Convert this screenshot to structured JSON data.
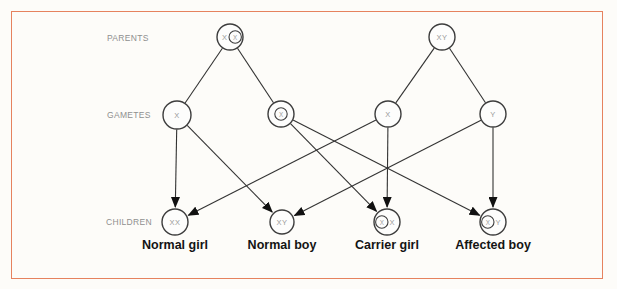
{
  "figure": {
    "background": "#fdfcf9",
    "border_color": "#e6825f",
    "line_color": "#333333",
    "arrow_color": "#111111",
    "node_stroke": "#3d3d3d",
    "node_fill": "#fdfdfc",
    "allele_color": "#9a9a9a",
    "row_label_color": "#8f8f8f",
    "caption_color": "#141414"
  },
  "diagram": {
    "row_labels": [
      {
        "id": "parents",
        "text": "PARENTS",
        "x": 107,
        "y": 41
      },
      {
        "id": "gametes",
        "text": "GAMETES",
        "x": 107,
        "y": 118
      },
      {
        "id": "children",
        "text": "CHILDREN",
        "x": 106,
        "y": 225
      }
    ],
    "nodes": [
      {
        "id": "mother",
        "row": "parents",
        "x": 230,
        "y": 37,
        "r": 13,
        "parts": [
          {
            "text": "X",
            "circled": false
          },
          {
            "text": "X",
            "circled": true
          }
        ]
      },
      {
        "id": "father",
        "row": "parents",
        "x": 442,
        "y": 37,
        "r": 13,
        "parts": [
          {
            "text": "XY",
            "circled": false
          }
        ]
      },
      {
        "id": "gamete-x-mother",
        "row": "gametes",
        "x": 177,
        "y": 115,
        "r": 14,
        "parts": [
          {
            "text": "X",
            "circled": false
          }
        ]
      },
      {
        "id": "gamete-xcarrier-mother",
        "row": "gametes",
        "x": 281,
        "y": 114,
        "r": 13,
        "parts": [
          {
            "text": "X",
            "circled": true
          }
        ]
      },
      {
        "id": "gamete-x-father",
        "row": "gametes",
        "x": 388,
        "y": 114,
        "r": 13,
        "parts": [
          {
            "text": "X",
            "circled": false
          }
        ]
      },
      {
        "id": "gamete-y-father",
        "row": "gametes",
        "x": 493,
        "y": 114,
        "r": 13,
        "parts": [
          {
            "text": "Y",
            "circled": false
          }
        ]
      },
      {
        "id": "child-normal-girl",
        "row": "children",
        "x": 175,
        "y": 222,
        "r": 13,
        "parts": [
          {
            "text": "XX",
            "circled": false
          }
        ],
        "caption": "Normal girl"
      },
      {
        "id": "child-normal-boy",
        "row": "children",
        "x": 282,
        "y": 222,
        "r": 12,
        "parts": [
          {
            "text": "XY",
            "circled": false
          }
        ],
        "caption": "Normal boy"
      },
      {
        "id": "child-carrier-girl",
        "row": "children",
        "x": 387,
        "y": 222,
        "r": 13,
        "parts": [
          {
            "text": "X",
            "circled": true
          },
          {
            "text": "X",
            "circled": false
          }
        ],
        "caption": "Carrier girl"
      },
      {
        "id": "child-affected-boy",
        "row": "children",
        "x": 493,
        "y": 222,
        "r": 13,
        "parts": [
          {
            "text": "X",
            "circled": true
          },
          {
            "text": "Y",
            "circled": false
          }
        ],
        "caption": "Affected boy"
      }
    ],
    "edges": [
      {
        "from": "mother",
        "to": "gamete-x-mother",
        "arrow": false
      },
      {
        "from": "mother",
        "to": "gamete-xcarrier-mother",
        "arrow": false
      },
      {
        "from": "father",
        "to": "gamete-x-father",
        "arrow": false
      },
      {
        "from": "father",
        "to": "gamete-y-father",
        "arrow": false
      },
      {
        "from": "gamete-x-mother",
        "to": "child-normal-girl",
        "arrow": true
      },
      {
        "from": "gamete-x-mother",
        "to": "child-normal-boy",
        "arrow": true
      },
      {
        "from": "gamete-xcarrier-mother",
        "to": "child-carrier-girl",
        "arrow": true
      },
      {
        "from": "gamete-xcarrier-mother",
        "to": "child-affected-boy",
        "arrow": true
      },
      {
        "from": "gamete-x-father",
        "to": "child-normal-girl",
        "arrow": true
      },
      {
        "from": "gamete-x-father",
        "to": "child-carrier-girl",
        "arrow": true
      },
      {
        "from": "gamete-y-father",
        "to": "child-normal-boy",
        "arrow": true
      },
      {
        "from": "gamete-y-father",
        "to": "child-affected-boy",
        "arrow": true
      }
    ]
  }
}
